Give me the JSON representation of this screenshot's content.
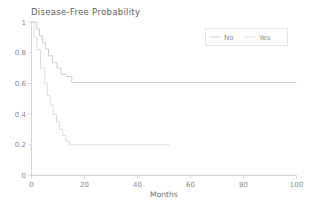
{
  "chart_data": {
    "type": "line",
    "subtype": "kaplan-meier-step",
    "title": "Disease-Free Probability",
    "xlabel": "Months",
    "ylabel": "",
    "xlim": [
      0,
      100
    ],
    "ylim": [
      0,
      1
    ],
    "xticks": [
      0,
      20,
      40,
      60,
      80,
      100
    ],
    "xtick_labels": [
      "0",
      "20",
      "40",
      "60",
      "80",
      "100"
    ],
    "yticks": [
      0,
      0.2,
      0.4,
      0.6,
      0.8,
      1
    ],
    "ytick_labels": [
      "0",
      "0.2",
      "0.4",
      "0.6",
      "0.8",
      "1"
    ],
    "grid": false,
    "legend_position": "upper right",
    "legend_title": "",
    "series": [
      {
        "name": "No",
        "color": "#c6c6c6",
        "final_value": 0.605,
        "last_x": 100,
        "points": [
          [
            0,
            1.0
          ],
          [
            2.0,
            1.0
          ],
          [
            2.0,
            0.955
          ],
          [
            3.0,
            0.955
          ],
          [
            3.0,
            0.91
          ],
          [
            4.2,
            0.91
          ],
          [
            4.2,
            0.865
          ],
          [
            5.2,
            0.865
          ],
          [
            5.2,
            0.825
          ],
          [
            6.4,
            0.825
          ],
          [
            6.4,
            0.78
          ],
          [
            8.0,
            0.78
          ],
          [
            8.0,
            0.735
          ],
          [
            9.6,
            0.735
          ],
          [
            9.6,
            0.7
          ],
          [
            11.2,
            0.7
          ],
          [
            11.2,
            0.66
          ],
          [
            13.0,
            0.66
          ],
          [
            13.0,
            0.645
          ],
          [
            15.2,
            0.645
          ],
          [
            15.2,
            0.605
          ],
          [
            100,
            0.605
          ]
        ]
      },
      {
        "name": "Yes",
        "color": "#d8d8d8",
        "final_value": 0.2,
        "last_x": 52,
        "points": [
          [
            0,
            1.0
          ],
          [
            1.0,
            1.0
          ],
          [
            1.0,
            0.9
          ],
          [
            2.0,
            0.9
          ],
          [
            2.0,
            0.82
          ],
          [
            3.4,
            0.82
          ],
          [
            3.4,
            0.7
          ],
          [
            5.0,
            0.7
          ],
          [
            5.0,
            0.6
          ],
          [
            6.0,
            0.6
          ],
          [
            6.0,
            0.52
          ],
          [
            7.0,
            0.52
          ],
          [
            7.0,
            0.46
          ],
          [
            8.2,
            0.46
          ],
          [
            8.2,
            0.4
          ],
          [
            9.4,
            0.4
          ],
          [
            9.4,
            0.35
          ],
          [
            10.6,
            0.35
          ],
          [
            10.6,
            0.3
          ],
          [
            11.8,
            0.3
          ],
          [
            11.8,
            0.26
          ],
          [
            13.0,
            0.26
          ],
          [
            13.0,
            0.225
          ],
          [
            14.2,
            0.225
          ],
          [
            14.2,
            0.2
          ],
          [
            52,
            0.2
          ]
        ]
      }
    ]
  },
  "legend": {
    "items": [
      {
        "label": "No"
      },
      {
        "label": "Yes"
      }
    ]
  },
  "colors": {
    "axis": "#c9c9c9",
    "title_text": "#5e5e5e",
    "tick_text": "#8a8a8a",
    "legend_border": "#dcdcdc",
    "series_no": "#c6c6c6",
    "series_yes": "#d8d8d8",
    "background": "#ffffff"
  }
}
